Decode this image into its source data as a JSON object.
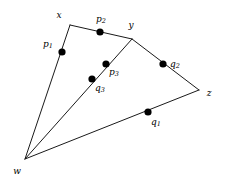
{
  "figure": {
    "width": 226,
    "height": 179,
    "background_color": "#ffffff",
    "stroke_color": "#1a1a1a",
    "dot_color": "#000000"
  },
  "vertices": [
    {
      "id": "w",
      "label": "w",
      "sub": "",
      "x": 25,
      "y": 159,
      "label_x": 17,
      "label_y": 171
    },
    {
      "id": "x",
      "label": "x",
      "sub": "",
      "x": 70,
      "y": 25,
      "label_x": 59,
      "label_y": 15
    },
    {
      "id": "y",
      "label": "y",
      "sub": "",
      "x": 132,
      "y": 39,
      "label_x": 131,
      "label_y": 25
    },
    {
      "id": "z",
      "label": "z",
      "sub": "",
      "x": 199,
      "y": 90,
      "label_x": 209,
      "label_y": 93
    }
  ],
  "edges": [
    {
      "id": "w-x",
      "from": "w",
      "to": "x",
      "x1": 25,
      "y1": 159,
      "x2": 70,
      "y2": 25
    },
    {
      "id": "x-y",
      "from": "x",
      "to": "y",
      "x1": 70,
      "y1": 25,
      "x2": 132,
      "y2": 39
    },
    {
      "id": "y-z",
      "from": "y",
      "to": "z",
      "x1": 132,
      "y1": 39,
      "x2": 199,
      "y2": 90
    },
    {
      "id": "z-w",
      "from": "z",
      "to": "w",
      "x1": 199,
      "y1": 90,
      "x2": 25,
      "y2": 159
    }
  ],
  "chords": [
    {
      "id": "w-y",
      "from": "w",
      "to": "y",
      "x1": 25,
      "y1": 159,
      "x2": 132,
      "y2": 39
    }
  ],
  "points": [
    {
      "id": "p1",
      "label": "p",
      "sub": "1",
      "on_edge": "w-x",
      "x": 62,
      "y": 52,
      "label_x": 48,
      "label_y": 45,
      "radius": 3.6
    },
    {
      "id": "p2",
      "label": "p",
      "sub": "2",
      "on_edge": "x-y",
      "x": 100,
      "y": 32,
      "label_x": 101,
      "label_y": 20,
      "radius": 3.6
    },
    {
      "id": "p3",
      "label": "p",
      "sub": "3",
      "on_edge": "w-y",
      "x": 106,
      "y": 64,
      "label_x": 114,
      "label_y": 73,
      "radius": 3.6
    },
    {
      "id": "q3",
      "label": "q",
      "sub": "3",
      "on_edge": "w-y",
      "x": 92,
      "y": 79,
      "label_x": 100,
      "label_y": 89,
      "radius": 3.6
    },
    {
      "id": "q2",
      "label": "q",
      "sub": "2",
      "on_edge": "y-z",
      "x": 163,
      "y": 64,
      "label_x": 175,
      "label_y": 65,
      "radius": 3.6
    },
    {
      "id": "q1",
      "label": "q",
      "sub": "1",
      "on_edge": "z-w",
      "x": 148,
      "y": 112,
      "label_x": 156,
      "label_y": 123,
      "radius": 3.6
    }
  ]
}
